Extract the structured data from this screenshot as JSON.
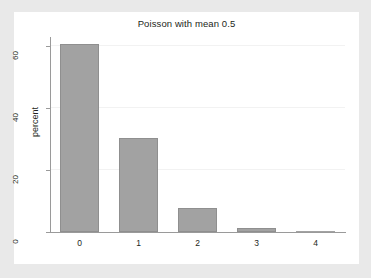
{
  "chart_data": {
    "type": "bar",
    "title": "Poisson with mean 0.5",
    "xlabel": "",
    "ylabel": "percent",
    "categories": [
      "0",
      "1",
      "2",
      "3",
      "4"
    ],
    "values": [
      60.6,
      30.3,
      7.6,
      1.3,
      0.2
    ],
    "ylim": [
      0,
      63
    ],
    "yticks": [
      0,
      20,
      40,
      60
    ],
    "ytick_labels": [
      "0",
      "20",
      "40",
      "60"
    ],
    "xticks": [
      0,
      1,
      2,
      3,
      4
    ],
    "xtick_labels": [
      "0",
      "1",
      "2",
      "3",
      "4"
    ],
    "grid": true,
    "grid_axis": "y",
    "legend": false,
    "legend_position": "none",
    "bar_color": "#a2a2a2",
    "bar_edge_color": "#8f8f8f",
    "plot_background": "#ffffff",
    "figure_background": "#e9e9e9",
    "axis_color": "#9a9a9a",
    "text_color": "#231f20",
    "gridline_color": "#f2f2f2"
  }
}
